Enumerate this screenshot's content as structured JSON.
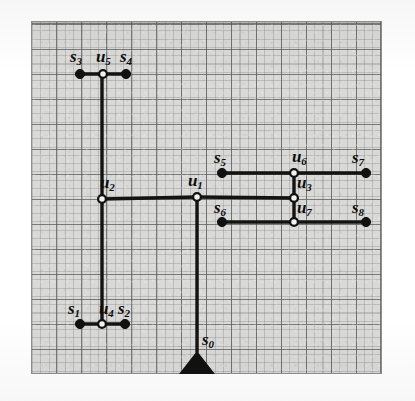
{
  "figure": {
    "kind": "routing-tree-diagram",
    "background_color": "#d9d9d7",
    "ink_color": "#111111",
    "grid_color": "#8e8e8e",
    "plot_box": {
      "x": 31,
      "y": 21,
      "width": 351,
      "height": 353
    },
    "grid": {
      "major_spacing": 25,
      "minor_spacing": 8.3,
      "visible": true
    }
  },
  "nodes": [
    {
      "id": "s0",
      "label": "s",
      "sub": "0",
      "type": "anchor",
      "x": 197,
      "y": 374,
      "label_x": 202,
      "label_y": 331
    },
    {
      "id": "s1",
      "label": "s",
      "sub": "1",
      "type": "sink",
      "x": 80,
      "y": 324,
      "label_x": 68,
      "label_y": 300
    },
    {
      "id": "s2",
      "label": "s",
      "sub": "2",
      "type": "sink",
      "x": 125,
      "y": 324,
      "label_x": 118,
      "label_y": 300
    },
    {
      "id": "s3",
      "label": "s",
      "sub": "3",
      "type": "sink",
      "x": 80,
      "y": 74,
      "label_x": 70,
      "label_y": 48
    },
    {
      "id": "s4",
      "label": "s",
      "sub": "4",
      "type": "sink",
      "x": 126,
      "y": 74,
      "label_x": 120,
      "label_y": 48
    },
    {
      "id": "s5",
      "label": "s",
      "sub": "5",
      "type": "sink",
      "x": 222,
      "y": 173,
      "label_x": 214,
      "label_y": 149
    },
    {
      "id": "s6",
      "label": "s",
      "sub": "6",
      "type": "sink",
      "x": 222,
      "y": 222,
      "label_x": 214,
      "label_y": 199
    },
    {
      "id": "s7",
      "label": "s",
      "sub": "7",
      "type": "sink",
      "x": 366,
      "y": 173,
      "label_x": 352,
      "label_y": 149
    },
    {
      "id": "s8",
      "label": "s",
      "sub": "8",
      "type": "sink",
      "x": 366,
      "y": 222,
      "label_x": 352,
      "label_y": 199
    },
    {
      "id": "u1",
      "label": "u",
      "sub": "1",
      "type": "steiner",
      "x": 197,
      "y": 197,
      "label_x": 188,
      "label_y": 172
    },
    {
      "id": "u2",
      "label": "u",
      "sub": "2",
      "type": "steiner",
      "x": 102,
      "y": 199,
      "label_x": 100,
      "label_y": 174
    },
    {
      "id": "u3",
      "label": "u",
      "sub": "3",
      "type": "steiner",
      "x": 294,
      "y": 198,
      "label_x": 297,
      "label_y": 174
    },
    {
      "id": "u4",
      "label": "u",
      "sub": "4",
      "type": "steiner",
      "x": 102,
      "y": 324,
      "label_x": 99,
      "label_y": 300
    },
    {
      "id": "u5",
      "label": "u",
      "sub": "5",
      "type": "steiner",
      "x": 103,
      "y": 74,
      "label_x": 96,
      "label_y": 48
    },
    {
      "id": "u6",
      "label": "u",
      "sub": "6",
      "type": "steiner",
      "x": 294,
      "y": 173,
      "label_x": 292,
      "label_y": 148
    },
    {
      "id": "u7",
      "label": "u",
      "sub": "7",
      "type": "steiner",
      "x": 294,
      "y": 222,
      "label_x": 297,
      "label_y": 199
    }
  ],
  "edges": [
    {
      "from": "s0",
      "to": "u1",
      "path": "M 197 352 L 197 197"
    },
    {
      "from": "u1",
      "to": "u2",
      "path": "M 197 197 L 102 199"
    },
    {
      "from": "u2",
      "to": "u5",
      "path": "M 102 199 L 102 74"
    },
    {
      "from": "u2",
      "to": "u4",
      "path": "M 102 199 L 102 324"
    },
    {
      "from": "u5",
      "to": "s3",
      "path": "M 103 74 L 80 74"
    },
    {
      "from": "u5",
      "to": "s4",
      "path": "M 103 74 L 126 74"
    },
    {
      "from": "u4",
      "to": "s1",
      "path": "M 102 324 L 80 324"
    },
    {
      "from": "u4",
      "to": "s2",
      "path": "M 102 324 L 125 324"
    },
    {
      "from": "u1",
      "to": "u3",
      "path": "M 197 197 L 294 198"
    },
    {
      "from": "u3",
      "to": "u6",
      "path": "M 294 198 L 294 173"
    },
    {
      "from": "u3",
      "to": "u7",
      "path": "M 294 198 L 294 222"
    },
    {
      "from": "u6",
      "to": "s5",
      "path": "M 294 173 L 222 173"
    },
    {
      "from": "u6",
      "to": "s7",
      "path": "M 294 173 L 366 173"
    },
    {
      "from": "u7",
      "to": "s6",
      "path": "M 294 222 L 222 222"
    },
    {
      "from": "u7",
      "to": "s8",
      "path": "M 294 222 L 366 222"
    }
  ],
  "anchor_marker": {
    "name": "source-triangle",
    "apex_x": 197,
    "apex_y": 351,
    "base_left_x": 179,
    "base_right_x": 215,
    "base_y": 374
  }
}
